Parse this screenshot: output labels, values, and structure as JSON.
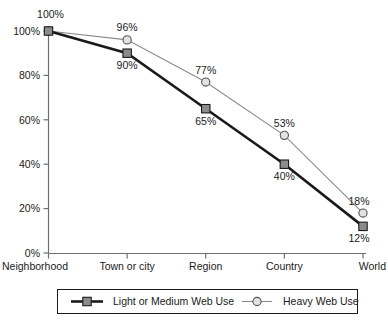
{
  "chart_data": {
    "type": "line",
    "title": "",
    "xlabel": "",
    "ylabel": "",
    "categories": [
      "Neighborhood",
      "Town or city",
      "Region",
      "Country",
      "World"
    ],
    "ylim": [
      0,
      100
    ],
    "ytick_labels": [
      "0%",
      "20%",
      "40%",
      "60%",
      "80%",
      "100%"
    ],
    "ytick_values": [
      0,
      20,
      40,
      60,
      80,
      100
    ],
    "grid": false,
    "legend_position": "bottom",
    "series": [
      {
        "name": "Light or Medium Web Use",
        "values": [
          100,
          90,
          65,
          40,
          12
        ],
        "labels": [
          "100%",
          "90%",
          "65%",
          "40%",
          "12%"
        ],
        "marker": "square",
        "marker_fill": "#8c8c8c",
        "marker_stroke": "#1a1a1a",
        "line_color": "#1a1a1a",
        "line_width": 2.6
      },
      {
        "name": "Heavy Web Use",
        "values": [
          100,
          96,
          77,
          53,
          18
        ],
        "labels": [
          "100%",
          "96%",
          "77%",
          "53%",
          "18%"
        ],
        "marker": "circle",
        "marker_fill": "#e2e2e2",
        "marker_stroke": "#555555",
        "line_color": "#8a8a8a",
        "line_width": 1.1
      }
    ],
    "axis_color": "#6e6e6e"
  },
  "legend": {
    "items": [
      {
        "label": "Light or Medium Web Use",
        "marker": "square-marker"
      },
      {
        "label": "Heavy Web Use",
        "marker": "circle-marker"
      }
    ]
  }
}
